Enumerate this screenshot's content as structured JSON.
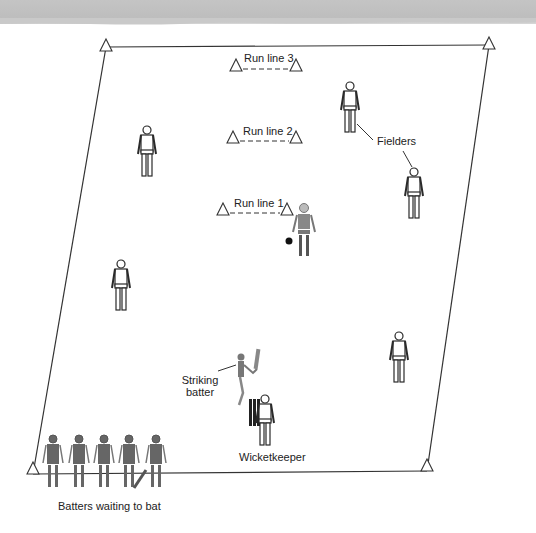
{
  "diagram": {
    "labels": {
      "run_line_3": "Run line 3",
      "run_line_2": "Run line 2",
      "run_line_1": "Run line 1",
      "fielders": "Fielders",
      "striking_batter_1": "Striking",
      "striking_batter_2": "batter",
      "wicketkeeper": "Wicketkeeper",
      "batters_waiting": "Batters waiting to bat"
    },
    "colors": {
      "line": "#333333",
      "figure_outline": "#2a2a2a",
      "batter_fill": "#6e6e6e",
      "banner": "#c2c2c2"
    },
    "field_corners": [
      {
        "name": "top-left",
        "x": 106,
        "y": 47
      },
      {
        "name": "top-right",
        "x": 489,
        "y": 45
      },
      {
        "name": "bottom-right",
        "x": 427,
        "y": 471
      },
      {
        "name": "bottom-left",
        "x": 33,
        "y": 474
      }
    ]
  }
}
